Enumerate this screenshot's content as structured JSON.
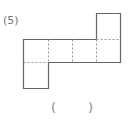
{
  "question": {
    "number_label": "(5)",
    "answer_open": "(",
    "answer_close": ")",
    "answer_value": ""
  },
  "diagram": {
    "type": "cube-net",
    "cell_size_px": 24,
    "squares": [
      {
        "row": 0,
        "col": 3
      },
      {
        "row": 1,
        "col": 0
      },
      {
        "row": 1,
        "col": 1
      },
      {
        "row": 1,
        "col": 2
      },
      {
        "row": 1,
        "col": 3
      },
      {
        "row": 2,
        "col": 0
      }
    ],
    "solid_line_color": "#666666",
    "fold_line_color": "#999999",
    "fold_line_style": "dashed"
  }
}
